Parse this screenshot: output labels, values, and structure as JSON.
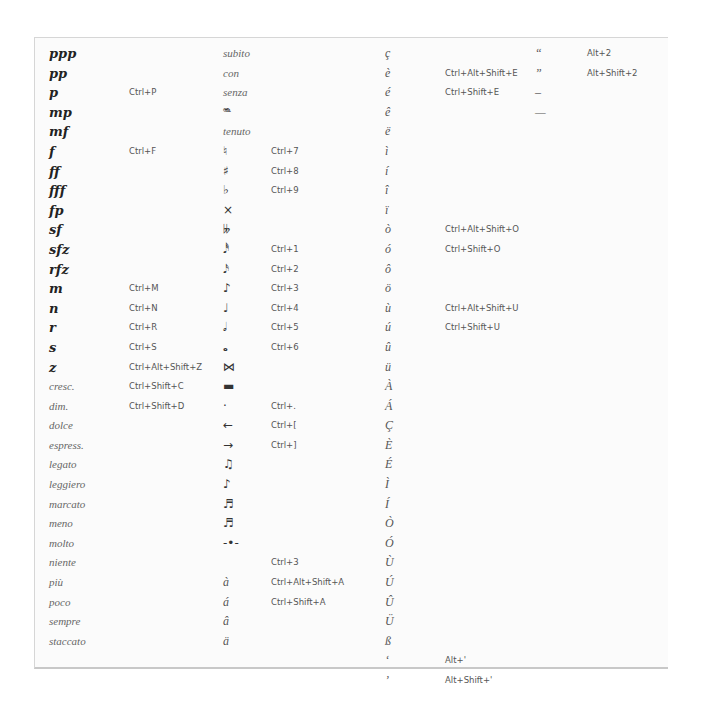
{
  "column1": [
    {
      "symbol": "ppp",
      "shortcut": ""
    },
    {
      "symbol": "pp",
      "shortcut": ""
    },
    {
      "symbol": "p",
      "shortcut": "Ctrl+P"
    },
    {
      "symbol": "mp",
      "shortcut": ""
    },
    {
      "symbol": "mf",
      "shortcut": ""
    },
    {
      "symbol": "f",
      "shortcut": "Ctrl+F"
    },
    {
      "symbol": "ff",
      "shortcut": ""
    },
    {
      "symbol": "fff",
      "shortcut": ""
    },
    {
      "symbol": "fp",
      "shortcut": ""
    },
    {
      "symbol": "sf",
      "shortcut": ""
    },
    {
      "symbol": "sfz",
      "shortcut": ""
    },
    {
      "symbol": "rfz",
      "shortcut": ""
    },
    {
      "symbol": "m",
      "shortcut": "Ctrl+M"
    },
    {
      "symbol": "n",
      "shortcut": "Ctrl+N"
    },
    {
      "symbol": "r",
      "shortcut": "Ctrl+R"
    },
    {
      "symbol": "s",
      "shortcut": "Ctrl+S"
    },
    {
      "symbol": "z",
      "shortcut": "Ctrl+Alt+Shift+Z"
    },
    {
      "symbol": "cresc.",
      "shortcut": "Ctrl+Shift+C"
    },
    {
      "symbol": "dim.",
      "shortcut": "Ctrl+Shift+D"
    },
    {
      "symbol": "dolce",
      "shortcut": ""
    },
    {
      "symbol": "espress.",
      "shortcut": ""
    },
    {
      "symbol": "legato",
      "shortcut": ""
    },
    {
      "symbol": "leggiero",
      "shortcut": ""
    },
    {
      "symbol": "marcato",
      "shortcut": ""
    },
    {
      "symbol": "meno",
      "shortcut": ""
    },
    {
      "symbol": "molto",
      "shortcut": ""
    },
    {
      "symbol": "niente",
      "shortcut": ""
    },
    {
      "symbol": "più",
      "shortcut": ""
    },
    {
      "symbol": "poco",
      "shortcut": ""
    },
    {
      "symbol": "sempre",
      "shortcut": ""
    },
    {
      "symbol": "staccato",
      "shortcut": ""
    }
  ],
  "column2": [
    {
      "symbol": "subito",
      "shortcut": "",
      "kind": "term"
    },
    {
      "symbol": "con",
      "shortcut": "",
      "kind": "term"
    },
    {
      "symbol": "senza",
      "shortcut": "",
      "kind": "term"
    },
    {
      "symbol": "𝆮",
      "shortcut": "",
      "kind": "musym",
      "icon": "pedal-icon"
    },
    {
      "symbol": "tenuto",
      "shortcut": "",
      "kind": "term"
    },
    {
      "symbol": "♮",
      "shortcut": "Ctrl+7",
      "kind": "musym",
      "icon": "natural-icon"
    },
    {
      "symbol": "♯",
      "shortcut": "Ctrl+8",
      "kind": "musym",
      "icon": "sharp-icon"
    },
    {
      "symbol": "♭",
      "shortcut": "Ctrl+9",
      "kind": "musym",
      "icon": "flat-icon"
    },
    {
      "symbol": "×",
      "shortcut": "",
      "kind": "musym",
      "icon": "double-sharp-icon"
    },
    {
      "symbol": "𝄫",
      "shortcut": "",
      "kind": "musym",
      "icon": "double-flat-icon"
    },
    {
      "symbol": "𝅘𝅥𝅰",
      "shortcut": "Ctrl+1",
      "kind": "musym",
      "icon": "sixty-fourth-note-icon"
    },
    {
      "symbol": "𝅘𝅥𝅯",
      "shortcut": "Ctrl+2",
      "kind": "musym",
      "icon": "thirty-second-note-icon"
    },
    {
      "symbol": "♪",
      "shortcut": "Ctrl+3",
      "kind": "musym",
      "icon": "eighth-note-icon"
    },
    {
      "symbol": "♩",
      "shortcut": "Ctrl+4",
      "kind": "musym",
      "icon": "quarter-note-icon"
    },
    {
      "symbol": "𝅗𝅥",
      "shortcut": "Ctrl+5",
      "kind": "musym",
      "icon": "half-note-icon"
    },
    {
      "symbol": "𝅝",
      "shortcut": "Ctrl+6",
      "kind": "musym",
      "icon": "whole-note-icon"
    },
    {
      "symbol": "⋈",
      "shortcut": "",
      "kind": "musym",
      "icon": "double-whole-note-icon"
    },
    {
      "symbol": "▬",
      "shortcut": "",
      "kind": "musym",
      "icon": "rest-icon"
    },
    {
      "symbol": "·",
      "shortcut": "Ctrl+.",
      "kind": "musym",
      "icon": "dot-icon"
    },
    {
      "symbol": "←",
      "shortcut": "Ctrl+[",
      "kind": "musym",
      "icon": "arrow-left-icon"
    },
    {
      "symbol": "→",
      "shortcut": "Ctrl+]",
      "kind": "musym",
      "icon": "arrow-right-icon"
    },
    {
      "symbol": "♫",
      "shortcut": "",
      "kind": "musym",
      "icon": "beamed-eighths-icon"
    },
    {
      "symbol": "♪",
      "shortcut": "",
      "kind": "musym",
      "icon": "beamed-note-icon"
    },
    {
      "symbol": "♬",
      "shortcut": "",
      "kind": "musym",
      "icon": "beamed-sixteenth-icon"
    },
    {
      "symbol": "♬",
      "shortcut": "",
      "kind": "musym",
      "icon": "beamed-thirty-second-icon"
    },
    {
      "symbol": "-•-",
      "shortcut": "",
      "kind": "musym",
      "icon": "tuplet-icon"
    },
    {
      "symbol": "",
      "shortcut": "Ctrl+3",
      "kind": "musym"
    },
    {
      "symbol": "à",
      "shortcut": "Ctrl+Alt+Shift+A",
      "kind": "acc"
    },
    {
      "symbol": "á",
      "shortcut": "Ctrl+Shift+A",
      "kind": "acc"
    },
    {
      "symbol": "â",
      "shortcut": "",
      "kind": "acc"
    },
    {
      "symbol": "ä",
      "shortcut": "",
      "kind": "acc"
    }
  ],
  "column3": [
    {
      "symbol": "ç",
      "shortcut": ""
    },
    {
      "symbol": "è",
      "shortcut": "Ctrl+Alt+Shift+E"
    },
    {
      "symbol": "é",
      "shortcut": "Ctrl+Shift+E"
    },
    {
      "symbol": "ê",
      "shortcut": ""
    },
    {
      "symbol": "ë",
      "shortcut": ""
    },
    {
      "symbol": "ì",
      "shortcut": ""
    },
    {
      "symbol": "í",
      "shortcut": ""
    },
    {
      "symbol": "î",
      "shortcut": ""
    },
    {
      "symbol": "ï",
      "shortcut": ""
    },
    {
      "symbol": "ò",
      "shortcut": "Ctrl+Alt+Shift+O"
    },
    {
      "symbol": "ó",
      "shortcut": "Ctrl+Shift+O"
    },
    {
      "symbol": "ô",
      "shortcut": ""
    },
    {
      "symbol": "ö",
      "shortcut": ""
    },
    {
      "symbol": "ù",
      "shortcut": "Ctrl+Alt+Shift+U"
    },
    {
      "symbol": "ú",
      "shortcut": "Ctrl+Shift+U"
    },
    {
      "symbol": "û",
      "shortcut": ""
    },
    {
      "symbol": "ü",
      "shortcut": ""
    },
    {
      "symbol": "À",
      "shortcut": ""
    },
    {
      "symbol": "Á",
      "shortcut": ""
    },
    {
      "symbol": "Ç",
      "shortcut": ""
    },
    {
      "symbol": "È",
      "shortcut": ""
    },
    {
      "symbol": "É",
      "shortcut": ""
    },
    {
      "symbol": "Ì",
      "shortcut": ""
    },
    {
      "symbol": "Í",
      "shortcut": ""
    },
    {
      "symbol": "Ò",
      "shortcut": ""
    },
    {
      "symbol": "Ó",
      "shortcut": ""
    },
    {
      "symbol": "Ù",
      "shortcut": ""
    },
    {
      "symbol": "Ú",
      "shortcut": ""
    },
    {
      "symbol": "Û",
      "shortcut": ""
    },
    {
      "symbol": "Ü",
      "shortcut": ""
    },
    {
      "symbol": "ß",
      "shortcut": ""
    },
    {
      "symbol": "‘",
      "shortcut": "Alt+'"
    },
    {
      "symbol": "’",
      "shortcut": "Alt+Shift+'"
    }
  ],
  "column4": [
    {
      "symbol": "“",
      "shortcut": "Alt+2"
    },
    {
      "symbol": "”",
      "shortcut": "Alt+Shift+2"
    },
    {
      "symbol": "–",
      "shortcut": ""
    },
    {
      "symbol": "—",
      "shortcut": ""
    }
  ]
}
